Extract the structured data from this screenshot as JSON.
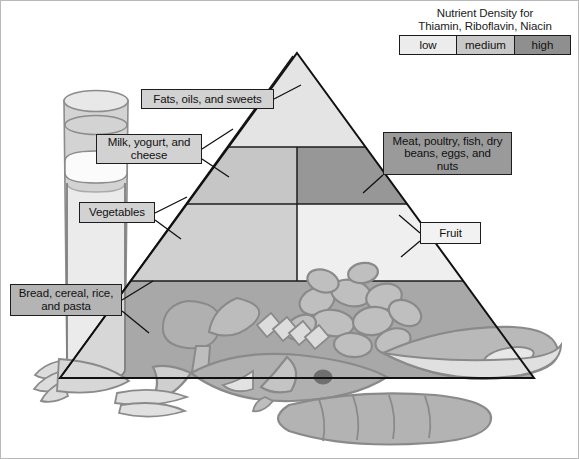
{
  "figure": {
    "background": "#ffffff",
    "border_color": "#b9b9b9"
  },
  "legend": {
    "title": "Nutrient Density for\nThiamin, Riboflavin, Niacin",
    "items": [
      {
        "label": "low",
        "color": "#ececec"
      },
      {
        "label": "medium",
        "color": "#c8c8c8"
      },
      {
        "label": "high",
        "color": "#8f8f8f"
      }
    ]
  },
  "pyramid": {
    "tiers": [
      {
        "name": "apex",
        "label": "Fats, oils, and sweets",
        "density": "low",
        "fill": "#e4e4e4"
      },
      {
        "name": "tier-2-left",
        "label": "Milk, yogurt, and\ncheese",
        "density": "medium",
        "fill": "#c6c6c6"
      },
      {
        "name": "tier-2-right",
        "label": "Meat, poultry, fish, dry\nbeans, eggs, and\nnuts",
        "density": "high",
        "fill": "#979797"
      },
      {
        "name": "tier-3-left",
        "label": "Vegetables",
        "density": "medium",
        "fill": "#d0d0d0"
      },
      {
        "name": "tier-3-right",
        "label": "Fruit",
        "density": "low",
        "fill": "#efefef"
      },
      {
        "name": "base",
        "label": "Bread, cereal, rice,\nand pasta",
        "density": "high",
        "fill": "#a8a8a8"
      }
    ]
  },
  "illustration": {
    "objects": [
      "milk-glass",
      "broccoli",
      "carrot",
      "pasta-shells",
      "fish",
      "bread-loaf",
      "banana",
      "cheese-wedge"
    ],
    "fills": {
      "body": "#b0b0b0",
      "light": "#dcdcdc",
      "outline": "#8a8a8a",
      "dark": "#8f8f8f"
    }
  },
  "colors": {
    "ink": "#1b1b1b",
    "callout_light": "#d2d2d2",
    "callout_mid": "#b4b4b4",
    "callout_dark": "#9a9a9a",
    "callout_pale": "#f2f2f2"
  }
}
